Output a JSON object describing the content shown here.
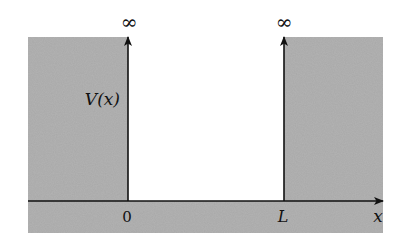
{
  "diagram": {
    "labels": {
      "potential": "V(x)",
      "left_height": "∞",
      "right_height": "∞",
      "origin": "0",
      "well_width": "L",
      "axis": "x"
    },
    "colors": {
      "wall_fill": "#a9a9a9",
      "background": "#ffffff",
      "line": "#111111"
    }
  }
}
